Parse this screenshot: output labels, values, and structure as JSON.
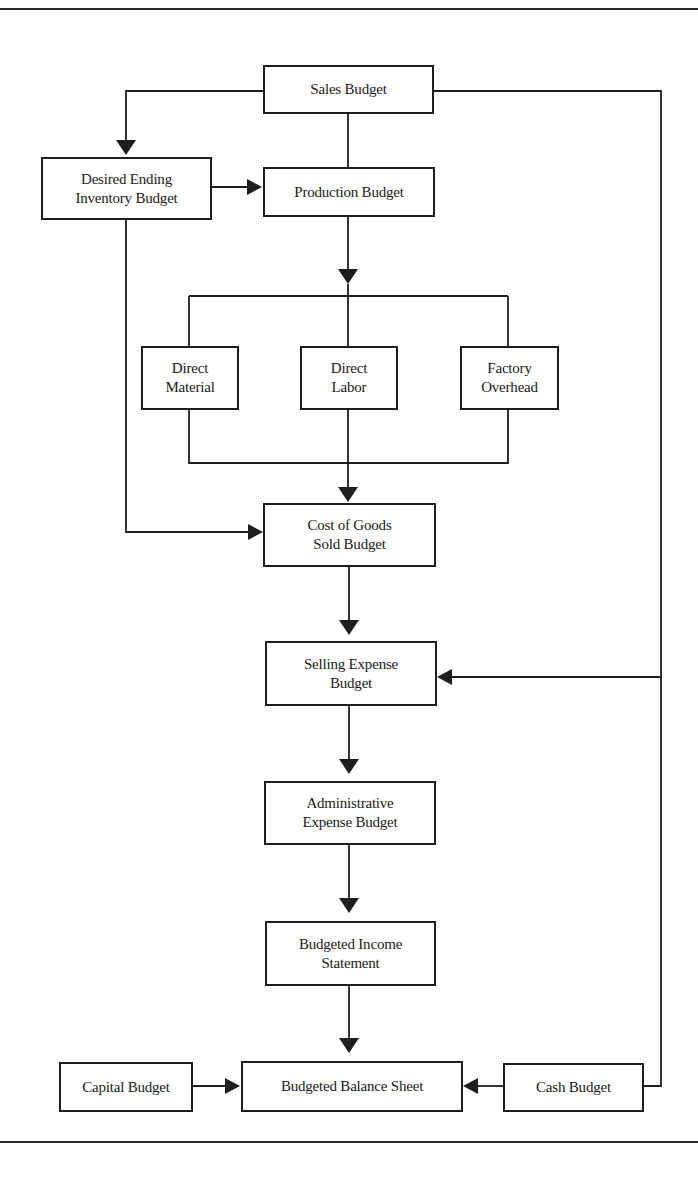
{
  "diagram": {
    "type": "flowchart",
    "title": "",
    "nodes": {
      "sales_budget": "Sales Budget",
      "desired_ending_inventory_budget": "Desired Ending\nInventory Budget",
      "production_budget": "Production Budget",
      "direct_material": "Direct\nMaterial",
      "direct_labor": "Direct\nLabor",
      "factory_overhead": "Factory\nOverhead",
      "cost_of_goods_sold_budget": "Cost of Goods\nSold Budget",
      "selling_expense_budget": "Selling Expense\nBudget",
      "administrative_expense_budget": "Administrative\nExpense Budget",
      "budgeted_income_statement": "Budgeted Income\nStatement",
      "capital_budget": "Capital Budget",
      "budgeted_balance_sheet": "Budgeted Balance Sheet",
      "cash_budget": "Cash Budget"
    },
    "edges": [
      {
        "from": "Sales Budget",
        "to": "Desired Ending Inventory Budget"
      },
      {
        "from": "Sales Budget",
        "to": "Production Budget"
      },
      {
        "from": "Sales Budget",
        "to": "Selling Expense Budget"
      },
      {
        "from": "Sales Budget",
        "to": "Cash Budget"
      },
      {
        "from": "Desired Ending Inventory Budget",
        "to": "Production Budget"
      },
      {
        "from": "Desired Ending Inventory Budget",
        "to": "Cost of Goods Sold Budget"
      },
      {
        "from": "Production Budget",
        "to": "Direct Material"
      },
      {
        "from": "Production Budget",
        "to": "Direct Labor"
      },
      {
        "from": "Production Budget",
        "to": "Factory Overhead"
      },
      {
        "from": "Direct Material",
        "to": "Cost of Goods Sold Budget"
      },
      {
        "from": "Direct Labor",
        "to": "Cost of Goods Sold Budget"
      },
      {
        "from": "Factory Overhead",
        "to": "Cost of Goods Sold Budget"
      },
      {
        "from": "Cost of Goods Sold Budget",
        "to": "Selling Expense Budget"
      },
      {
        "from": "Selling Expense Budget",
        "to": "Administrative Expense Budget"
      },
      {
        "from": "Administrative Expense Budget",
        "to": "Budgeted Income Statement"
      },
      {
        "from": "Budgeted Income Statement",
        "to": "Budgeted Balance Sheet"
      },
      {
        "from": "Capital Budget",
        "to": "Budgeted Balance Sheet"
      },
      {
        "from": "Cash Budget",
        "to": "Budgeted Balance Sheet"
      }
    ]
  },
  "colors": {
    "line": "#1e1e1e",
    "background": "#ffffff"
  }
}
